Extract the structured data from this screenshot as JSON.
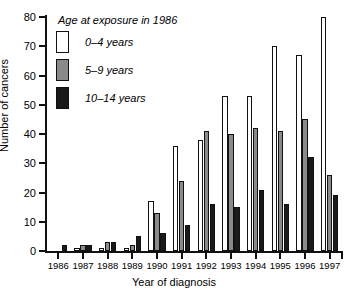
{
  "chart_data": {
    "type": "bar",
    "title": "",
    "xlabel": "Year of diagnosis",
    "ylabel": "Number of cancers",
    "legend_title": "Age at exposure in 1986",
    "legend_position": "top-left",
    "grid": false,
    "ylim": [
      0,
      80
    ],
    "yticks": [
      0,
      10,
      20,
      30,
      40,
      50,
      60,
      70,
      80
    ],
    "categories": [
      "1986",
      "1987",
      "1988",
      "1989",
      "1990",
      "1991",
      "1992",
      "1993",
      "1994",
      "1995",
      "1996",
      "1997"
    ],
    "series": [
      {
        "name": "0–4 years",
        "color": "#ffffff",
        "values": [
          0,
          1,
          1,
          1,
          17,
          36,
          38,
          53,
          53,
          70,
          67,
          80
        ]
      },
      {
        "name": "5–9 years",
        "color": "#8a8a8a",
        "values": [
          0,
          2,
          3,
          2,
          13,
          24,
          41,
          40,
          42,
          41,
          45,
          26
        ]
      },
      {
        "name": "10–14 years",
        "color": "#1a1a1a",
        "values": [
          2,
          2,
          3,
          5,
          6,
          9,
          16,
          15,
          21,
          16,
          32,
          19
        ]
      }
    ]
  },
  "axis": {
    "y_title": "Number of cancers",
    "x_title": "Year of diagnosis"
  }
}
